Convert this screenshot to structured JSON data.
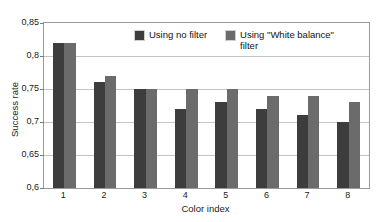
{
  "chart_data": {
    "type": "bar",
    "title": "",
    "subtitle": "",
    "xlabel": "Color index",
    "ylabel": "Success rate",
    "categories": [
      "1",
      "2",
      "3",
      "4",
      "5",
      "6",
      "7",
      "8"
    ],
    "series": [
      {
        "name": "Using no filter",
        "color": "#3d3d3d",
        "values": [
          0.82,
          0.76,
          0.75,
          0.72,
          0.73,
          0.72,
          0.71,
          0.7
        ]
      },
      {
        "name": "Using \"White balance\" filter",
        "color": "#6b6b6b",
        "values": [
          0.82,
          0.77,
          0.75,
          0.75,
          0.75,
          0.74,
          0.74,
          0.73
        ]
      }
    ],
    "ylim": [
      0.6,
      0.85
    ],
    "y_ticks": [
      0.85,
      0.8,
      0.75,
      0.7,
      0.65,
      0.6
    ],
    "y_tick_labels": [
      "0,85",
      "0,8",
      "0,75",
      "0,7",
      "0,65",
      "0,6"
    ],
    "grid": true,
    "grid_axis": "y",
    "legend_position": "inside-top-center",
    "decimal_separator": ","
  }
}
